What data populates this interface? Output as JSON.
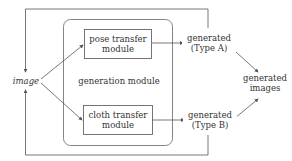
{
  "diagram": {
    "input": {
      "label": "image"
    },
    "container": {
      "label": "generation module"
    },
    "modules": [
      {
        "line1": "pose transfer",
        "line2": "module"
      },
      {
        "line1": "cloth transfer",
        "line2": "module"
      }
    ],
    "outputs": [
      {
        "line1": "generated",
        "line2": "(Type A)"
      },
      {
        "line1": "generated",
        "line2": "(Type B)"
      }
    ],
    "final": {
      "line1": "generated",
      "line2": "images"
    },
    "colors": {
      "stroke": "#555555",
      "text": "#333333"
    }
  }
}
